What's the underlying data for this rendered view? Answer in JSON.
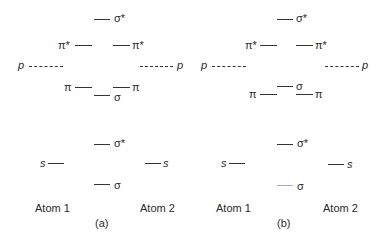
{
  "panels": [
    {
      "caption": "(a)",
      "atom_left": "Atom 1",
      "atom_right": "Atom 2",
      "p_orbitals": {
        "left_label": "p",
        "right_label": "p",
        "sigma_star": "σ*",
        "pi_star_left": "π*",
        "pi_star_right": "π*",
        "pi_left": "π",
        "pi_right": "π",
        "sigma": "σ"
      },
      "s_orbitals": {
        "left_label": "s",
        "right_label": "s",
        "sigma_star": "σ*",
        "sigma": "σ"
      }
    },
    {
      "caption": "(b)",
      "atom_left": "Atom 1",
      "atom_right": "Atom 2",
      "p_orbitals": {
        "left_label": "p",
        "right_label": "p",
        "sigma_star": "σ*",
        "pi_star_left": "π*",
        "pi_star_right": "π*",
        "pi_left": "π",
        "pi_right": "π",
        "sigma": "σ"
      },
      "s_orbitals": {
        "left_label": "s",
        "right_label": "s",
        "sigma_star": "σ*",
        "sigma": "σ"
      }
    }
  ]
}
